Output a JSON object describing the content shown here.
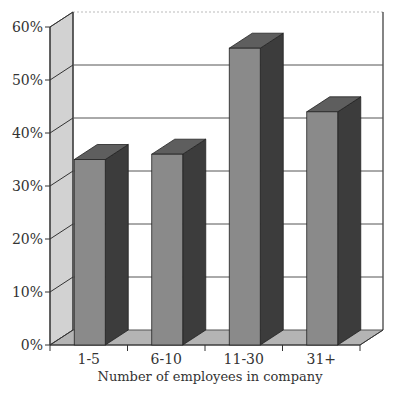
{
  "chart_data": {
    "type": "bar",
    "title": "",
    "xlabel": "Number of employees in company",
    "ylabel": "",
    "categories": [
      "1-5",
      "6-10",
      "11-30",
      "31+"
    ],
    "values": [
      35,
      36,
      56,
      44
    ],
    "ylim": [
      0,
      60
    ],
    "yticks": [
      "0%",
      "10%",
      "20%",
      "30%",
      "40%",
      "50%",
      "60%"
    ],
    "grid": true,
    "legend": null,
    "style": "3d",
    "colors": {
      "front": "#8a8a8a",
      "side": "#3c3c3c",
      "top": "#5e5e5e",
      "wall": "#d2d2d2",
      "floor": "#b4b4b4"
    }
  }
}
